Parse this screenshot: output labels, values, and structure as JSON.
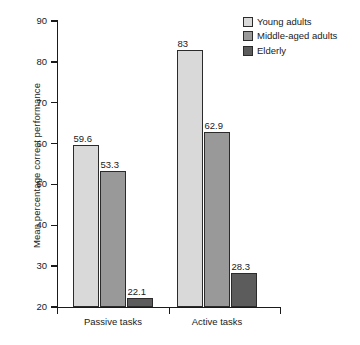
{
  "chart_data": {
    "type": "bar",
    "title": "",
    "xlabel": "",
    "ylabel": "Mean percentage correct performance",
    "categories": [
      "Passive tasks",
      "Active tasks"
    ],
    "series": [
      {
        "name": "Young adults",
        "color": "#d9d9d9",
        "values": [
          59.6,
          83
        ]
      },
      {
        "name": "Middle-aged adults",
        "color": "#999999",
        "values": [
          53.3,
          62.9
        ]
      },
      {
        "name": "Elderly",
        "color": "#5c5c5c",
        "values": [
          22.1,
          28.3
        ]
      }
    ],
    "value_labels": [
      [
        "59.6",
        "53.3",
        "22.1"
      ],
      [
        "83",
        "62.9",
        "28.3"
      ]
    ],
    "ylim": [
      20,
      90
    ],
    "ytick_values": [
      20,
      30,
      40,
      50,
      60,
      70,
      80,
      90
    ],
    "ytick_labels": [
      "20",
      "30",
      "40",
      "50",
      "60",
      "70",
      "80",
      "90"
    ],
    "grid": false,
    "legend_position": "top-right"
  },
  "legend": {
    "items": [
      {
        "label": "Young adults"
      },
      {
        "label": "Middle-aged adults"
      },
      {
        "label": "Elderly"
      }
    ]
  },
  "axes": {
    "y_title": "Mean percentage correct performance"
  }
}
